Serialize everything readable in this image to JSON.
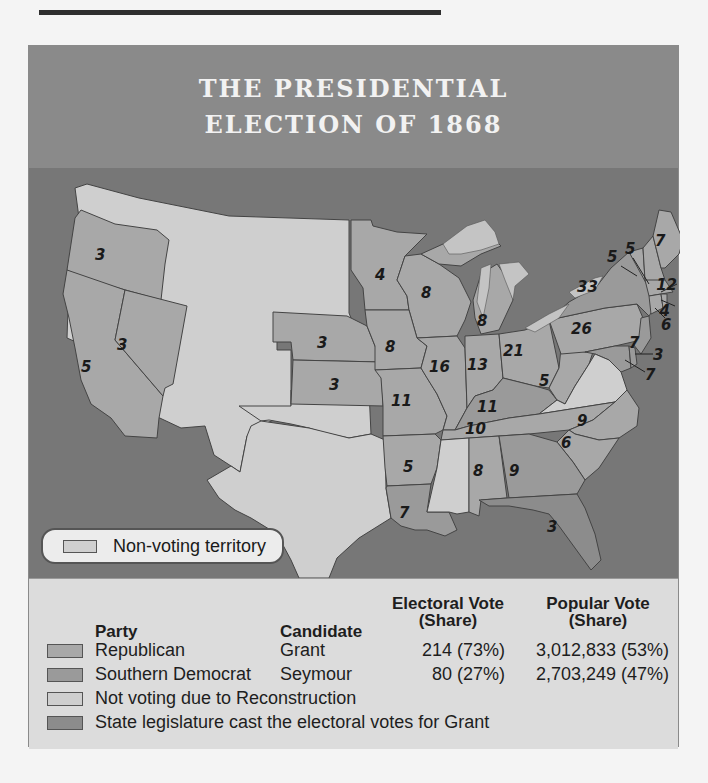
{
  "title": {
    "line1": "THE PRESIDENTIAL",
    "line2": "ELECTION OF 1868"
  },
  "colors": {
    "header_bg": "#8a8a8a",
    "ocean": "#777777",
    "republican": "#a8a8a8",
    "southern_democrat": "#9a9a9a",
    "not_voting": "#cfcfcf",
    "legislature": "#8c8c8c",
    "non_voting_territory": "#cfcfcf",
    "lakes": "#c4c4c4"
  },
  "map": {
    "inset_legend": {
      "label": "Non-voting territory",
      "icon": "swatch-non-voting-territory"
    },
    "states": [
      {
        "name": "Oregon",
        "votes": "3",
        "category": "republican"
      },
      {
        "name": "California",
        "votes": "5",
        "category": "republican"
      },
      {
        "name": "Nevada",
        "votes": "3",
        "category": "republican"
      },
      {
        "name": "Nebraska",
        "votes": "3",
        "category": "republican"
      },
      {
        "name": "Kansas",
        "votes": "3",
        "category": "republican"
      },
      {
        "name": "Minnesota",
        "votes": "4",
        "category": "republican"
      },
      {
        "name": "Iowa",
        "votes": "8",
        "category": "republican"
      },
      {
        "name": "Missouri",
        "votes": "11",
        "category": "republican"
      },
      {
        "name": "Arkansas",
        "votes": "5",
        "category": "republican"
      },
      {
        "name": "Louisiana",
        "votes": "7",
        "category": "southern_democrat"
      },
      {
        "name": "Wisconsin",
        "votes": "8",
        "category": "republican"
      },
      {
        "name": "Illinois",
        "votes": "16",
        "category": "republican"
      },
      {
        "name": "Michigan",
        "votes": "8",
        "category": "republican"
      },
      {
        "name": "Indiana",
        "votes": "13",
        "category": "republican"
      },
      {
        "name": "Ohio",
        "votes": "21",
        "category": "republican"
      },
      {
        "name": "Kentucky",
        "votes": "11",
        "category": "southern_democrat"
      },
      {
        "name": "Tennessee",
        "votes": "10",
        "category": "republican"
      },
      {
        "name": "Alabama",
        "votes": "8",
        "category": "republican"
      },
      {
        "name": "Georgia",
        "votes": "9",
        "category": "southern_democrat"
      },
      {
        "name": "Florida",
        "votes": "3",
        "category": "legislature"
      },
      {
        "name": "South Carolina",
        "votes": "6",
        "category": "republican"
      },
      {
        "name": "North Carolina",
        "votes": "9",
        "category": "republican"
      },
      {
        "name": "West Virginia",
        "votes": "5",
        "category": "republican"
      },
      {
        "name": "Pennsylvania",
        "votes": "26",
        "category": "republican"
      },
      {
        "name": "New York",
        "votes": "33",
        "category": "southern_democrat"
      },
      {
        "name": "Vermont",
        "votes": "5",
        "category": "republican"
      },
      {
        "name": "New Hampshire",
        "votes": "5",
        "category": "republican"
      },
      {
        "name": "Maine",
        "votes": "7",
        "category": "republican"
      },
      {
        "name": "Massachusetts",
        "votes": "12",
        "category": "republican"
      },
      {
        "name": "Rhode Island",
        "votes": "4",
        "category": "republican"
      },
      {
        "name": "Connecticut",
        "votes": "6",
        "category": "republican"
      },
      {
        "name": "New Jersey",
        "votes": "7",
        "category": "southern_democrat"
      },
      {
        "name": "Delaware",
        "votes": "3",
        "category": "southern_democrat"
      },
      {
        "name": "Maryland",
        "votes": "7",
        "category": "southern_democrat"
      },
      {
        "name": "Virginia",
        "votes": "",
        "category": "not_voting"
      },
      {
        "name": "Mississippi",
        "votes": "",
        "category": "not_voting"
      },
      {
        "name": "Texas",
        "votes": "",
        "category": "not_voting"
      }
    ]
  },
  "legend": {
    "headers": {
      "party": "Party",
      "candidate": "Candidate",
      "electoral_line1": "Electoral Vote",
      "electoral_line2": "(Share)",
      "popular_line1": "Popular Vote",
      "popular_line2": "(Share)"
    },
    "rows": [
      {
        "party": "Republican",
        "candidate": "Grant",
        "electoral": "214 (73%)",
        "popular": "3,012,833 (53%)"
      },
      {
        "party": "Southern Democrat",
        "candidate": "Seymour",
        "electoral": "80 (27%)",
        "popular": "2,703,249 (47%)"
      },
      {
        "party": "Not voting due to Reconstruction",
        "candidate": "",
        "electoral": "",
        "popular": ""
      },
      {
        "party": "State legislature cast the electoral votes for Grant",
        "candidate": "",
        "electoral": "",
        "popular": ""
      }
    ]
  }
}
